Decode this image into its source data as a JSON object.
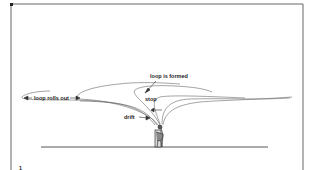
{
  "diagram": {
    "labels": {
      "loop_formed": "loop is formed",
      "loop_rolls_out": "loop rolls out",
      "stop": "stop",
      "drift": "drift"
    },
    "figure_number": "1",
    "colors": {
      "line": "#555555",
      "border": "#555555",
      "background": "#ffffff"
    }
  }
}
